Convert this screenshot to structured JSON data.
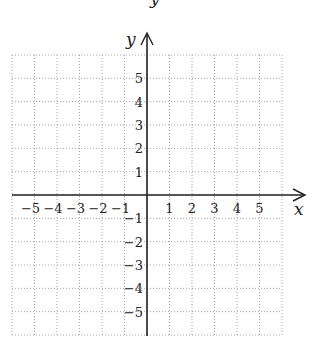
{
  "diagram": {
    "type": "coordinate-grid",
    "x_axis": {
      "label": "x",
      "min": -6,
      "max": 6,
      "tick_labels": [
        "-5",
        "-4",
        "-3",
        "-2",
        "-1",
        "1",
        "2",
        "3",
        "4",
        "5"
      ]
    },
    "y_axis": {
      "label": "y",
      "min": -6,
      "max": 6,
      "tick_labels": [
        "5",
        "4",
        "3",
        "2",
        "1",
        "-1",
        "-2",
        "-3",
        "-4",
        "-5"
      ]
    },
    "grid": {
      "style": "dotted",
      "cells_x": 12,
      "cells_y": 12
    },
    "top_partial_char": "y"
  },
  "colors": {
    "axis": "#222222",
    "grid": "#9a9a9a",
    "text": "#222222"
  }
}
